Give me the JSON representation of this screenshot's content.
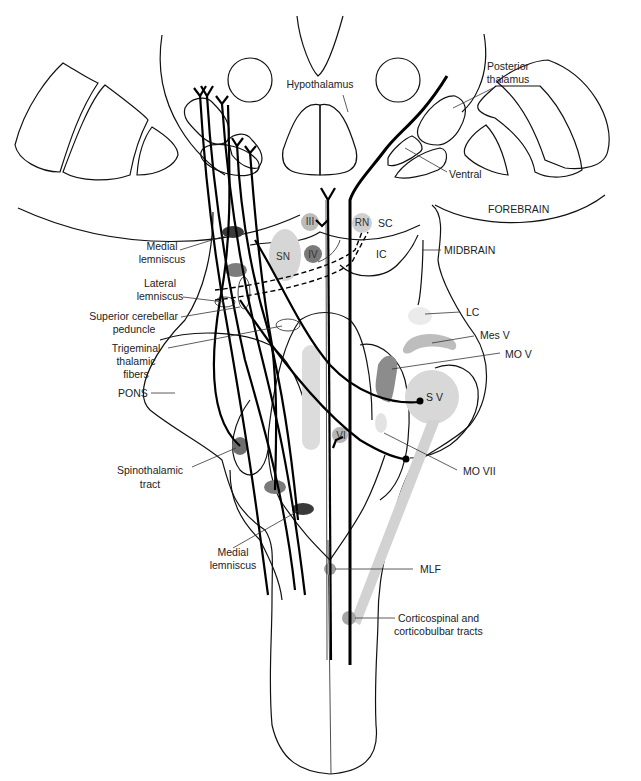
{
  "diagram": {
    "colors": {
      "light_gray": "#d9d9d9",
      "mid_gray": "#9a9a9a",
      "dark_gray": "#555555",
      "line": "#000000"
    },
    "labels": {
      "hypothalamus": "Hypothalamus",
      "posterior_thalamus_1": "Posterior",
      "posterior_thalamus_2": "thalamus",
      "ventral": "Ventral",
      "forebrain": "FOREBRAIN",
      "midbrain": "MIDBRAIN",
      "medial_lemniscus_top_1": "Medial",
      "medial_lemniscus_top_2": "lemniscus",
      "lateral_lemniscus_1": "Lateral",
      "lateral_lemniscus_2": "lemniscus",
      "superior_cerebellar_peduncle_1": "Superior cerebellar",
      "superior_cerebellar_peduncle_2": "peduncle",
      "trigeminal_thalamic_fibers_1": "Trigeminal",
      "trigeminal_thalamic_fibers_2": "thalamic",
      "trigeminal_thalamic_fibers_3": "fibers",
      "pons": "PONS",
      "spinothalamic_tract_1": "Spinothalamic",
      "spinothalamic_tract_2": "tract",
      "medial_lemniscus_bottom_1": "Medial",
      "medial_lemniscus_bottom_2": "lemniscus",
      "lc": "LC",
      "mes_v": "Mes V",
      "mo_v": "MO V",
      "s_v": "S V",
      "mo_vii": "MO VII",
      "mlf": "MLF",
      "corticospinal_1": "Corticospinal and",
      "corticospinal_2": "corticobulbar tracts",
      "sc": "SC",
      "ic": "IC"
    },
    "nuclei": {
      "iii": "III",
      "rn": "RN",
      "sn": "SN",
      "iv": "IV",
      "vi": "VI"
    }
  }
}
